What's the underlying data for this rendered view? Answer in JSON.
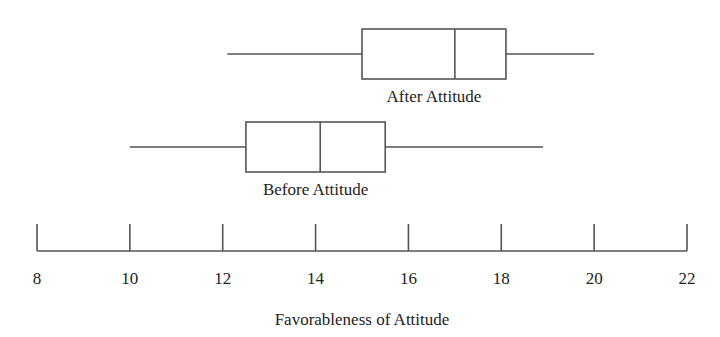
{
  "chart_data": {
    "type": "boxplot",
    "orientation": "horizontal",
    "title": "",
    "xlabel": "Favorableness of Attitude",
    "ylabel": "",
    "xlim": [
      8,
      22
    ],
    "x_ticks": [
      8,
      10,
      12,
      14,
      16,
      18,
      20,
      22
    ],
    "grid": false,
    "legend": null,
    "series": [
      {
        "name": "After Attitude",
        "min": 12.1,
        "q1": 15.0,
        "median": 17.0,
        "q3": 18.1,
        "max": 20.0
      },
      {
        "name": "Before Attitude",
        "min": 10.0,
        "q1": 12.5,
        "median": 14.1,
        "q3": 15.5,
        "max": 18.9
      }
    ],
    "colors": {
      "stroke": "#555555",
      "text": "#222222",
      "background": "#ffffff"
    }
  },
  "labels": {
    "after": "After Attitude",
    "before": "Before Attitude",
    "xaxis": "Favorableness of Attitude",
    "ticks": [
      "8",
      "10",
      "12",
      "14",
      "16",
      "18",
      "20",
      "22"
    ]
  }
}
